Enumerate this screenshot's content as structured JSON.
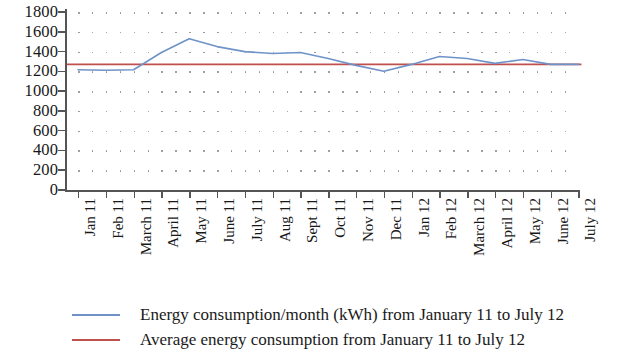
{
  "chart_data": {
    "type": "line",
    "title": "",
    "xlabel": "",
    "ylabel": "",
    "ylim": [
      0,
      1800
    ],
    "y_ticks": [
      0,
      200,
      400,
      600,
      800,
      1000,
      1200,
      1400,
      1600,
      1800
    ],
    "y_tick_labels": [
      "0",
      "200",
      "400",
      "600",
      "800",
      "1000",
      "1200",
      "1400",
      "1600",
      "1800"
    ],
    "grid": "dotted",
    "legend_position": "bottom-left",
    "categories": [
      "Jan 11",
      "Feb 11",
      "March 11",
      "April 11",
      "May 11",
      "June 11",
      "July 11",
      "Aug 11",
      "Sept 11",
      "Oct 11",
      "Nov 11",
      "Dec 11",
      "Jan 12",
      "Feb 12",
      "March 12",
      "April 12",
      "May 12",
      "June 12",
      "July 12"
    ],
    "series": [
      {
        "name": "Energy consumption/month (kWh) from January 11 to July 12",
        "color": "#6f93c8",
        "values": [
          1215,
          1210,
          1215,
          1390,
          1530,
          1450,
          1400,
          1380,
          1390,
          1330,
          1260,
          1200,
          1270,
          1350,
          1330,
          1280,
          1320,
          1270,
          1270
        ]
      },
      {
        "name": "Average energy consumption from January 11 to July 12",
        "color": "#c0504d",
        "type": "constant-line",
        "value": 1270
      }
    ],
    "legend": [
      {
        "label": "Energy consumption/month (kWh) from January 11 to July 12",
        "color": "#6f93c8"
      },
      {
        "label": "Average energy consumption from January 11 to July 12",
        "color": "#c0504d"
      }
    ]
  }
}
